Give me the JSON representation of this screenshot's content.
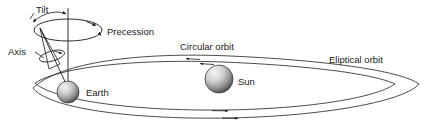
{
  "figure": {
    "background_color": "#ffffff",
    "line_color": "#1a1a1a",
    "width": 435,
    "height": 128
  },
  "labels": {
    "tilt": "Tilt",
    "axis": "Axis",
    "precession": "Precession",
    "circular_orbit": "Circular orbit",
    "elliptical_orbit": "Eliptical orbit",
    "earth": "Earth",
    "sun": "Sun"
  },
  "bodies": [
    {
      "name": "earth",
      "label": "Earth",
      "cx": 68,
      "cy": 92,
      "r": 11,
      "highlight_color": "#f2f2f2",
      "shadow_color": "#4a4a4a"
    },
    {
      "name": "sun",
      "label": "Sun",
      "cx": 219,
      "cy": 79,
      "r": 14,
      "highlight_color": "#f5f5f5",
      "shadow_color": "#555555"
    }
  ],
  "orbits": [
    {
      "name": "circular-orbit",
      "label": "Circular orbit",
      "direction": "counterclockwise",
      "arrow_count": 2
    },
    {
      "name": "elliptical-orbit",
      "label": "Eliptical orbit",
      "direction": "counterclockwise",
      "arrow_count": 2
    }
  ],
  "annotations": {
    "precession_direction": "clockwise-around-vertical-axis",
    "tilt_arrow": "double-headed-arc",
    "axis_rotation": "small-ellipse-on-axis"
  }
}
